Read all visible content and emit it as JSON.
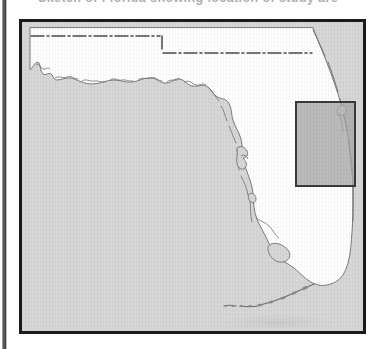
{
  "figure": {
    "caption": "Sketch of Florida showing location of study area",
    "caption_clipped": true
  },
  "map": {
    "title": "Florida locator map",
    "region_name": "Florida",
    "land_label": "Florida peninsula and panhandle",
    "water_label": "Gulf of Mexico and Atlantic Ocean",
    "keys_label": "Florida Keys",
    "state_line_label": "Georgia - Alabama state boundary",
    "frame_label": "map neatline border",
    "colors": {
      "water_fill": "#d7d7d7",
      "land_fill": "#ffffff",
      "coastline_stroke": "#6a6a6a",
      "state_line_stroke": "#4a4a4a",
      "frame_stroke": "#1b1b1b",
      "study_area_fill": "#a8a8a8",
      "study_area_stroke": "#3a3a3a"
    }
  },
  "study_area": {
    "label": "Study area",
    "shape": "rectangle",
    "description": "Highlighted rectangle on the northeast Atlantic coast of Florida",
    "x": 274,
    "y": 80,
    "width": 59,
    "height": 84
  },
  "artifacts": {
    "page_edge_label": "scanned page edge shadow"
  }
}
